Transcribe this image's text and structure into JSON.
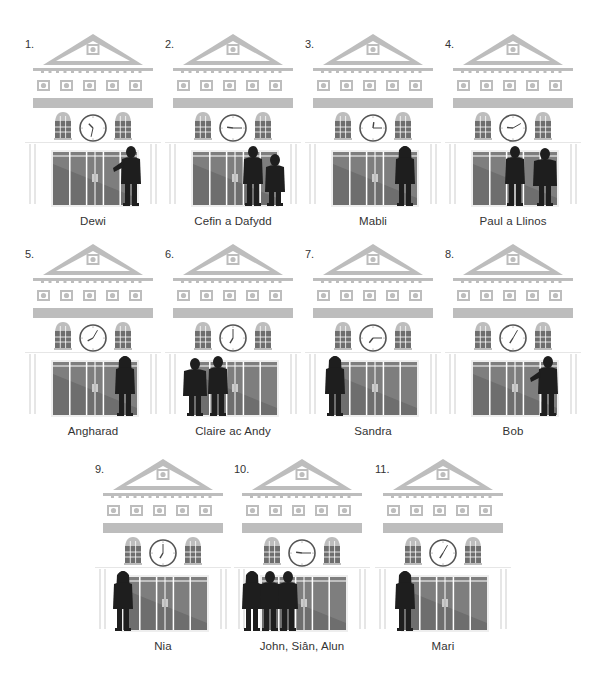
{
  "colors": {
    "building": "#bdbdbd",
    "building_light": "#e6e6e6",
    "glass_dark": "#6e6e6e",
    "glass_light": "#8c8c8c",
    "silhouette": "#1e1e1e",
    "text": "#333333"
  },
  "panels": [
    {
      "number": "1.",
      "caption": "Dewi",
      "clock": {
        "hour": 10,
        "minute": 32
      },
      "people": [
        {
          "x": 98,
          "type": "man-pointing"
        }
      ]
    },
    {
      "number": "2.",
      "caption": "Cefin a Dafydd",
      "clock": {
        "hour": 9,
        "minute": 15
      },
      "people": [
        {
          "x": 80,
          "type": "man"
        },
        {
          "x": 102,
          "type": "man-small"
        }
      ]
    },
    {
      "number": "3.",
      "caption": "Mabli",
      "clock": {
        "hour": 12,
        "minute": 15
      },
      "people": [
        {
          "x": 92,
          "type": "woman"
        }
      ]
    },
    {
      "number": "4.",
      "caption": "Paul a Llinos",
      "clock": {
        "hour": 9,
        "minute": 10
      },
      "people": [
        {
          "x": 62,
          "type": "man"
        },
        {
          "x": 90,
          "type": "woman-wide"
        }
      ]
    },
    {
      "number": "5.",
      "caption": "Angharad",
      "clock": {
        "hour": 8,
        "minute": 5
      },
      "people": [
        {
          "x": 92,
          "type": "woman"
        }
      ]
    },
    {
      "number": "6.",
      "caption": "Claire ac Andy",
      "clock": {
        "hour": 7,
        "minute": 0
      },
      "people": [
        {
          "x": 20,
          "type": "woman-wide"
        },
        {
          "x": 45,
          "type": "man"
        }
      ]
    },
    {
      "number": "7.",
      "caption": "Sandra",
      "clock": {
        "hour": 7,
        "minute": 15
      },
      "people": [
        {
          "x": 22,
          "type": "woman-long-hair"
        }
      ]
    },
    {
      "number": "8.",
      "caption": "Bob",
      "clock": {
        "hour": 7,
        "minute": 5
      },
      "people": [
        {
          "x": 95,
          "type": "man-pointing"
        }
      ]
    },
    {
      "number": "9.",
      "caption": "Nia",
      "clock": {
        "hour": 7,
        "minute": 0
      },
      "people": [
        {
          "x": 20,
          "type": "woman-long-hair"
        }
      ]
    },
    {
      "number": "10.",
      "caption": "John, Siân, Alun",
      "clock": {
        "hour": 9,
        "minute": 15
      },
      "people": [
        {
          "x": 10,
          "type": "woman"
        },
        {
          "x": 28,
          "type": "man"
        },
        {
          "x": 46,
          "type": "man"
        }
      ]
    },
    {
      "number": "11.",
      "caption": "Mari",
      "clock": {
        "hour": 7,
        "minute": 5
      },
      "people": [
        {
          "x": 22,
          "type": "woman-long-hair"
        }
      ]
    }
  ]
}
